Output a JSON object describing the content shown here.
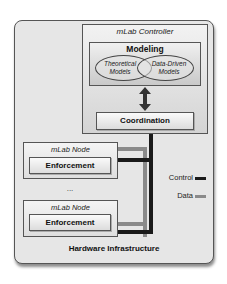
{
  "diagram": {
    "outer": {
      "label": "Hardware Infrastructure"
    },
    "controller": {
      "title": "mLab Controller",
      "modeling": {
        "title": "Modeling",
        "models": [
          {
            "line1": "Theoretical",
            "line2": "Models"
          },
          {
            "line1": "Data-Driven",
            "line2": "Models"
          }
        ]
      },
      "arrow": "bidirectional",
      "coordination": {
        "label": "Coordination"
      }
    },
    "nodes": [
      {
        "title": "mLab Node",
        "component": "Enforcement"
      },
      {
        "title": "mLab Node",
        "component": "Enforcement"
      }
    ],
    "ellipsis": "...",
    "legend": [
      {
        "label": "Control",
        "color": "#1a1a1a"
      },
      {
        "label": "Data",
        "color": "#8a8a8a"
      }
    ]
  }
}
